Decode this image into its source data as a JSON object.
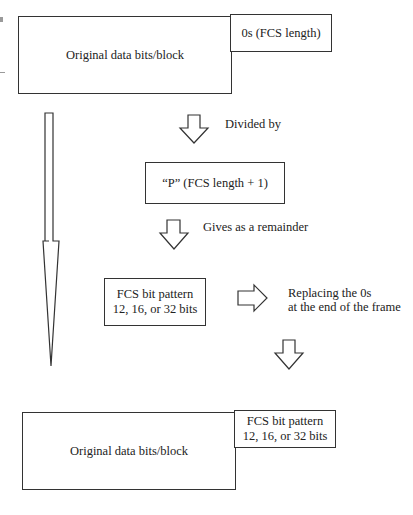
{
  "diagram": {
    "top_frame": {
      "data_block": "Original data bits/block",
      "zero_pad": "0s (FCS length)"
    },
    "step_divide": {
      "label": "Divided by",
      "divisor_box": "“P” (FCS length + 1)"
    },
    "step_remainder": {
      "label": "Gives as a remainder",
      "fcs_box_line1": "FCS bit pattern",
      "fcs_box_line2": "12, 16, or 32 bits"
    },
    "step_replace": {
      "label_line1": "Replacing the 0s",
      "label_line2": "at the end of the frame"
    },
    "bottom_frame": {
      "data_block": "Original data bits/block",
      "fcs_line1": "FCS bit pattern",
      "fcs_line2": "12, 16, or 32 bits"
    },
    "colors": {
      "stroke": "#333333",
      "text": "#222222",
      "background": "#ffffff"
    }
  }
}
